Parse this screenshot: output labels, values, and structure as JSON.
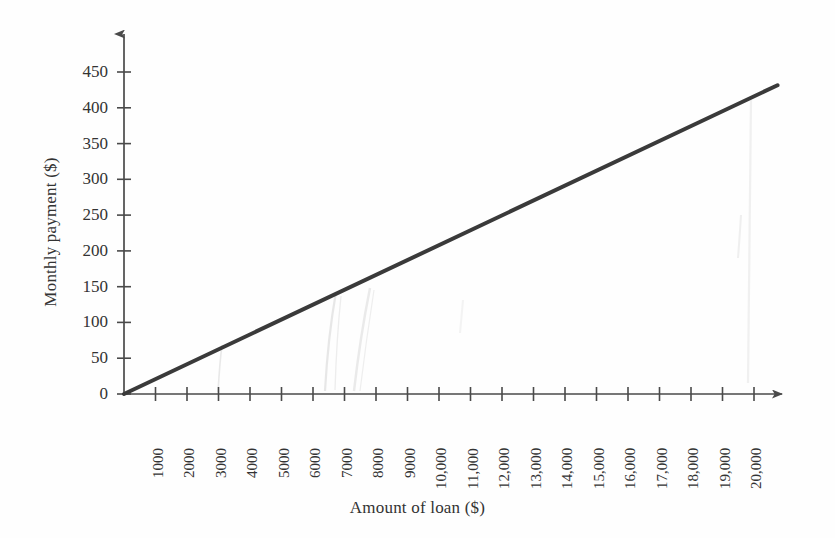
{
  "chart_data": {
    "type": "line",
    "title": "",
    "xlabel": "Amount of loan ($)",
    "ylabel": "Monthly payment ($)",
    "xlim": [
      0,
      20000
    ],
    "ylim": [
      0,
      450
    ],
    "grid": false,
    "legend": null,
    "x_tick_labels": [
      "1000",
      "2000",
      "3000",
      "4000",
      "5000",
      "6000",
      "7000",
      "8000",
      "9000",
      "10,000",
      "11,000",
      "12,000",
      "13,000",
      "14,000",
      "15,000",
      "16,000",
      "17,000",
      "18,000",
      "19,000",
      "20,000"
    ],
    "x_tick_values": [
      1000,
      2000,
      3000,
      4000,
      5000,
      6000,
      7000,
      8000,
      9000,
      10000,
      11000,
      12000,
      13000,
      14000,
      15000,
      16000,
      17000,
      18000,
      19000,
      20000
    ],
    "y_tick_labels": [
      "0",
      "50",
      "100",
      "150",
      "200",
      "250",
      "300",
      "350",
      "400",
      "450"
    ],
    "y_tick_values": [
      0,
      50,
      100,
      150,
      200,
      250,
      300,
      350,
      400,
      450
    ],
    "series": [
      {
        "name": "Monthly payment",
        "color": "#3a3a3a",
        "x": [
          0,
          20000
        ],
        "y": [
          0,
          416
        ],
        "points": [
          {
            "x": 0,
            "y": 0
          },
          {
            "x": 1000,
            "y": 21
          },
          {
            "x": 2000,
            "y": 42
          },
          {
            "x": 3000,
            "y": 62
          },
          {
            "x": 4000,
            "y": 83
          },
          {
            "x": 5000,
            "y": 104
          },
          {
            "x": 6000,
            "y": 125
          },
          {
            "x": 7000,
            "y": 146
          },
          {
            "x": 8000,
            "y": 166
          },
          {
            "x": 9000,
            "y": 187
          },
          {
            "x": 10000,
            "y": 208
          },
          {
            "x": 11000,
            "y": 229
          },
          {
            "x": 12000,
            "y": 250
          },
          {
            "x": 13000,
            "y": 270
          },
          {
            "x": 14000,
            "y": 291
          },
          {
            "x": 15000,
            "y": 312
          },
          {
            "x": 16000,
            "y": 333
          },
          {
            "x": 17000,
            "y": 354
          },
          {
            "x": 18000,
            "y": 374
          },
          {
            "x": 19000,
            "y": 395
          },
          {
            "x": 20000,
            "y": 416
          }
        ]
      }
    ]
  },
  "axes": {
    "y_axis_name": "y-axis",
    "x_axis_name": "x-axis"
  },
  "colors": {
    "line": "#3a3a3a",
    "axis": "#4a4a4a",
    "text": "#333333",
    "background": "#fefefe"
  }
}
